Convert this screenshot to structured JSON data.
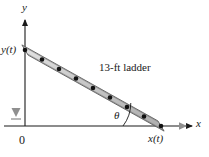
{
  "figure": {
    "labels": {
      "y_axis": "y",
      "x_axis": "x",
      "origin": "0",
      "wall_height": "y(t)",
      "floor_distance": "x(t)",
      "ladder": "13-ft ladder",
      "angle": "θ"
    },
    "colors": {
      "axis": "#1a1a1a",
      "ladder_fill": "#c9c9c9",
      "ladder_stroke": "#4a4a4a",
      "rung_dot": "#111111",
      "motion_arrow": "#9a9a9a",
      "text": "#1a1a1a",
      "background": "#ffffff"
    },
    "geometry": {
      "origin": {
        "x": 25,
        "y": 126
      },
      "ladder_top": {
        "x": 25,
        "y": 50
      },
      "ladder_bottom": {
        "x": 161,
        "y": 126
      },
      "ladder_width_px": 7,
      "rung_count": 9,
      "angle_arc_radius": 38,
      "x_axis_end": {
        "x": 195,
        "y": 126
      },
      "y_axis_end": {
        "x": 25,
        "y": 17
      }
    },
    "motion": {
      "wall_arrow": {
        "direction": "down",
        "x": 16,
        "y_start": 72,
        "y_end": 113
      },
      "floor_arrow": {
        "direction": "right",
        "y": 126,
        "x_start": 163,
        "x_end": 188
      }
    }
  }
}
